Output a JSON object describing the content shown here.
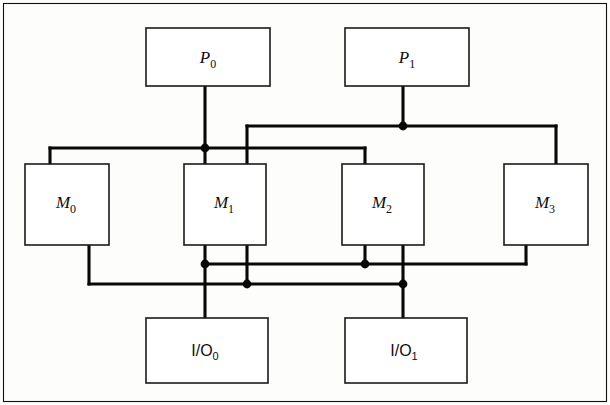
{
  "figure": {
    "background_color": "#fdfdfb",
    "line_color": "#080808",
    "box_fill": "#ffffff",
    "box_stroke": "#1a1a1a",
    "frame_stroke": "#111111",
    "width": 610,
    "height": 405
  },
  "nodes": {
    "p0": {
      "label_main": "P",
      "label_sub": "0",
      "full": "P0",
      "x": 146,
      "y": 28,
      "w": 124,
      "h": 58
    },
    "p1": {
      "label_main": "P",
      "label_sub": "1",
      "full": "P1",
      "x": 345,
      "y": 28,
      "w": 124,
      "h": 58
    },
    "m0": {
      "label_main": "M",
      "label_sub": "0",
      "full": "M0",
      "x": 25,
      "y": 164,
      "w": 84,
      "h": 81
    },
    "m1": {
      "label_main": "M",
      "label_sub": "1",
      "full": "M1",
      "x": 184,
      "y": 164,
      "w": 82,
      "h": 81
    },
    "m2": {
      "label_main": "M",
      "label_sub": "2",
      "full": "M2",
      "x": 342,
      "y": 164,
      "w": 82,
      "h": 81
    },
    "m3": {
      "label_main": "M",
      "label_sub": "3",
      "full": "M3",
      "x": 504,
      "y": 164,
      "w": 84,
      "h": 81
    },
    "io0": {
      "label_main": "I/O",
      "label_sub": "0",
      "full": "I/O0",
      "x": 146,
      "y": 318,
      "w": 122,
      "h": 65
    },
    "io1": {
      "label_main": "I/O",
      "label_sub": "1",
      "full": "I/O1",
      "x": 345,
      "y": 318,
      "w": 122,
      "h": 65
    }
  },
  "buses": {
    "p0_bus": {
      "name": "P0 memory bus",
      "y": 148,
      "x_start": 50,
      "x_end": 365
    },
    "p1_bus": {
      "name": "P1 memory bus",
      "y": 126,
      "x_start": 247,
      "x_end": 556
    },
    "io0_bus": {
      "name": "I/O0 bus",
      "y": 264,
      "x_start": 205,
      "x_end": 526
    },
    "io1_bus": {
      "name": "I/O1 bus",
      "y": 284,
      "x_start": 89,
      "x_end": 403
    }
  },
  "junctions": [
    {
      "name": "p0-bus-tap",
      "x": 205,
      "y": 148
    },
    {
      "name": "p1-bus-tap",
      "x": 403,
      "y": 126
    },
    {
      "name": "m1-io0-tap",
      "x": 205,
      "y": 264
    },
    {
      "name": "m2-io0-tap",
      "x": 365,
      "y": 264
    },
    {
      "name": "m1-io1-tap",
      "x": 247,
      "y": 284
    },
    {
      "name": "m2-io1-tap",
      "x": 403,
      "y": 284
    }
  ],
  "links": [
    {
      "name": "p0-to-bus",
      "from": "p0",
      "to": "p0_bus"
    },
    {
      "name": "p1-to-bus",
      "from": "p1",
      "to": "p1_bus"
    },
    {
      "name": "p0bus-to-m0",
      "from": "p0_bus",
      "to": "m0"
    },
    {
      "name": "p0bus-to-m1",
      "from": "p0_bus",
      "to": "m1"
    },
    {
      "name": "p0bus-to-m2",
      "from": "p0_bus",
      "to": "m2"
    },
    {
      "name": "p1bus-to-m1",
      "from": "p1_bus",
      "to": "m1"
    },
    {
      "name": "p1bus-to-m3",
      "from": "p1_bus",
      "to": "m3"
    },
    {
      "name": "m0-to-io1bus",
      "from": "m0",
      "to": "io1_bus"
    },
    {
      "name": "m1-to-io0bus",
      "from": "m1",
      "to": "io0_bus"
    },
    {
      "name": "m1-to-io1bus",
      "from": "m1",
      "to": "io1_bus"
    },
    {
      "name": "m2-to-io0bus",
      "from": "m2",
      "to": "io0_bus"
    },
    {
      "name": "m2-to-io1bus",
      "from": "m2",
      "to": "io1_bus"
    },
    {
      "name": "m3-to-io0bus",
      "from": "m3",
      "to": "io0_bus"
    },
    {
      "name": "io0bus-to-io0",
      "from": "io0_bus",
      "to": "io0"
    },
    {
      "name": "io1bus-to-io1",
      "from": "io1_bus",
      "to": "io1"
    }
  ]
}
